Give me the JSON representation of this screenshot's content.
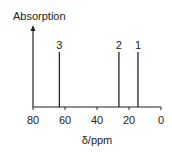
{
  "chart_data": {
    "type": "bar",
    "title": "",
    "xlabel": "δ/ppm",
    "ylabel": "Absorption",
    "xlim": [
      80,
      0
    ],
    "x_ticks": [
      80,
      60,
      40,
      20,
      0
    ],
    "x_tick_labels": [
      "80",
      "60",
      "40",
      "20",
      "0"
    ],
    "grid": false,
    "legend": null,
    "peaks": [
      {
        "label": "3",
        "shift_ppm": 63.5,
        "height": 1
      },
      {
        "label": "2",
        "shift_ppm": 26.3,
        "height": 1
      },
      {
        "label": "1",
        "shift_ppm": 14.4,
        "height": 1
      }
    ],
    "categories": [
      "3",
      "2",
      "1"
    ],
    "values": [
      1,
      1,
      1
    ]
  },
  "style": {
    "line_color": "#222222",
    "background": "#ffffff"
  }
}
